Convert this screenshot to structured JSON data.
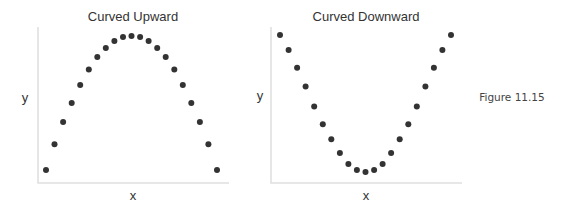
{
  "figure": {
    "caption": "Figure 11.15"
  },
  "chart_data": [
    {
      "type": "scatter",
      "title": "Curved Upward",
      "xlabel": "x",
      "ylabel": "y",
      "grid": false,
      "ticks": false,
      "x": [
        0,
        1,
        2,
        3,
        4,
        5,
        6,
        7,
        8,
        9,
        10,
        11,
        12,
        13,
        14,
        15,
        16,
        17,
        18,
        19,
        20
      ],
      "y": [
        0.0,
        19.4,
        36.0,
        50.4,
        64.0,
        75.5,
        84.9,
        91.7,
        97.1,
        100.0,
        100.7,
        100.0,
        97.1,
        91.7,
        84.9,
        75.5,
        64.0,
        50.4,
        36.0,
        19.4,
        0.0
      ],
      "xlim": [
        -1,
        21
      ],
      "ylim": [
        -10,
        110
      ],
      "shape": "concave down (inverted U)"
    },
    {
      "type": "scatter",
      "title": "Curved Downward",
      "xlabel": "x",
      "ylabel": "y",
      "grid": false,
      "ticks": false,
      "x": [
        0,
        1,
        2,
        3,
        4,
        5,
        6,
        7,
        8,
        9,
        10,
        11,
        12,
        13,
        14,
        15,
        16,
        17,
        18,
        19,
        20
      ],
      "y": [
        100.0,
        89.1,
        76.1,
        62.3,
        47.8,
        34.8,
        23.9,
        13.8,
        5.8,
        1.4,
        0.0,
        1.4,
        5.8,
        13.8,
        23.9,
        34.8,
        47.8,
        62.3,
        76.1,
        89.1,
        100.0
      ],
      "xlim": [
        -1,
        21
      ],
      "ylim": [
        -8,
        108
      ],
      "shape": "concave up (U)"
    }
  ]
}
